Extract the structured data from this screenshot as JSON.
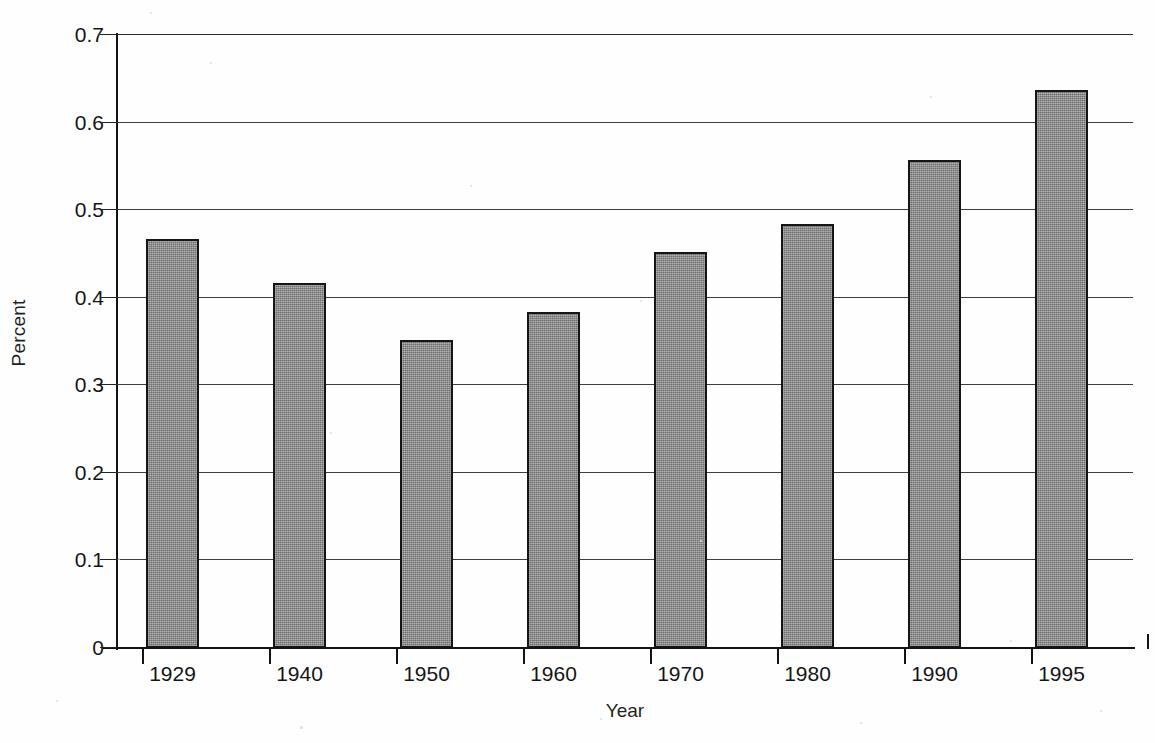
{
  "chart_data": {
    "type": "bar",
    "title": "",
    "subtitle": "",
    "xlabel": "Year",
    "ylabel": "Percent",
    "categories": [
      "1929",
      "1940",
      "1950",
      "1960",
      "1970",
      "1980",
      "1990",
      "1995"
    ],
    "values": [
      0.467,
      0.417,
      0.352,
      0.384,
      0.452,
      0.484,
      0.557,
      0.637
    ],
    "series": [
      {
        "name": "Percent",
        "values": [
          0.467,
          0.417,
          0.352,
          0.384,
          0.452,
          0.484,
          0.557,
          0.637
        ]
      }
    ],
    "ylim": [
      0,
      0.7
    ],
    "ytick_values": [
      0,
      0.1,
      0.2,
      0.3,
      0.4,
      0.5,
      0.6,
      0.7
    ],
    "ytick_labels": [
      "0",
      "0.1",
      "0.2",
      "0.3",
      "0.4",
      "0.5",
      "0.6",
      "0.7"
    ],
    "xtick_labels": [
      "1929",
      "1940",
      "1950",
      "1960",
      "1970",
      "1980",
      "1990",
      "1995"
    ],
    "grid": "horizontal",
    "legend": "none",
    "bar_color": "#868686",
    "bar_edge_color": "#151515",
    "axis_color": "#131313",
    "gridline_color": "#3d3d3d",
    "background_color": "#fefefe"
  }
}
